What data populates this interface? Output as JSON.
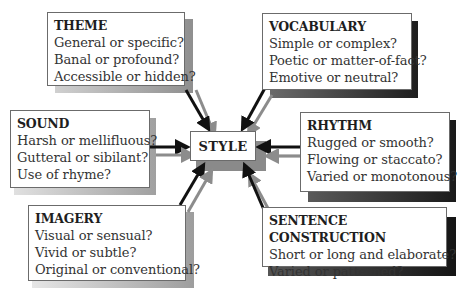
{
  "center": {
    "label": "STYLE"
  },
  "boxes": {
    "theme": {
      "title": "THEME",
      "lines": [
        "General or specific?",
        "Banal or profound?",
        "Accessible or hidden?"
      ]
    },
    "vocabulary": {
      "title": "VOCABULARY",
      "lines": [
        "Simple or complex?",
        "Poetic or matter-of-fact?",
        "Emotive or neutral?"
      ]
    },
    "sound": {
      "title": "SOUND",
      "lines": [
        "Harsh or mellifluous?",
        "Gutteral or sibilant?",
        "Use of rhyme?"
      ]
    },
    "rhythm": {
      "title": "RHYTHM",
      "lines": [
        "Rugged or smooth?",
        "Flowing or staccato?",
        "Varied or monotonous?"
      ]
    },
    "imagery": {
      "title": "IMAGERY",
      "lines": [
        "Visual or sensual?",
        "Vivid or subtle?",
        "Original or conventional?"
      ]
    },
    "sentence_construction": {
      "title": "SENTENCE CONSTRUCTION",
      "lines": [
        "Short or long and elaborate?",
        "Varied or patterned?"
      ]
    }
  },
  "colors": {
    "arrow_dark": "#111111",
    "arrow_gray": "#8c8c8c",
    "shadow_dark": "#2b2b2b",
    "shadow_gray": "#9a9a9a",
    "border": "#6b6b6b"
  }
}
